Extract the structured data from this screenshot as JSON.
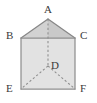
{
  "figure": {
    "name": "triangular-prism-diagram",
    "canvas": {
      "width": 97,
      "height": 103
    },
    "colors": {
      "background": "#ffffff",
      "stroke": "#8a8a8a",
      "stroke_dark": "#707070",
      "dashed_stroke": "#8d8d8d",
      "rect_fill": "#e2e2e2",
      "triangle_left_fill": "#d2d2d2",
      "triangle_right_fill": "#c9c9c9",
      "label_color": "#3a3a3a"
    },
    "vertices": [
      {
        "id": "A",
        "label": "A",
        "x": 48,
        "y": 19,
        "label_x": 44,
        "label_y": 4,
        "role": "apex"
      },
      {
        "id": "B",
        "label": "B",
        "x": 21,
        "y": 38,
        "label_x": 6,
        "label_y": 30,
        "role": "top-left"
      },
      {
        "id": "C",
        "label": "C",
        "x": 75,
        "y": 38,
        "label_x": 80,
        "label_y": 30,
        "role": "top-right"
      },
      {
        "id": "D",
        "label": "D",
        "x": 48,
        "y": 66,
        "label_x": 51,
        "label_y": 60,
        "role": "interior-hidden"
      },
      {
        "id": "E",
        "label": "E",
        "x": 21,
        "y": 89,
        "label_x": 6,
        "label_y": 83,
        "role": "bottom-left"
      },
      {
        "id": "F",
        "label": "F",
        "x": 75,
        "y": 89,
        "label_x": 80,
        "label_y": 83,
        "role": "bottom-right"
      }
    ],
    "solid_edges": [
      {
        "from": "B",
        "to": "A"
      },
      {
        "from": "A",
        "to": "C"
      },
      {
        "from": "B",
        "to": "C"
      },
      {
        "from": "B",
        "to": "E"
      },
      {
        "from": "C",
        "to": "F"
      },
      {
        "from": "E",
        "to": "F"
      }
    ],
    "dashed_edges": [
      {
        "from": "A",
        "to": "D"
      },
      {
        "from": "D",
        "to": "E"
      },
      {
        "from": "D",
        "to": "F"
      }
    ],
    "faces": [
      {
        "id": "rect-BCFE",
        "fill": "#e2e2e2",
        "points": "21,38 75,38 75,89 21,89"
      },
      {
        "id": "tri-left-BAD",
        "fill": "#d2d2d2",
        "points": "21,38 48,19 48,38"
      },
      {
        "id": "tri-right-ACD",
        "fill": "#c9c9c9",
        "points": "48,19 75,38 48,38"
      }
    ],
    "dash_pattern": "2.2 2.2"
  }
}
